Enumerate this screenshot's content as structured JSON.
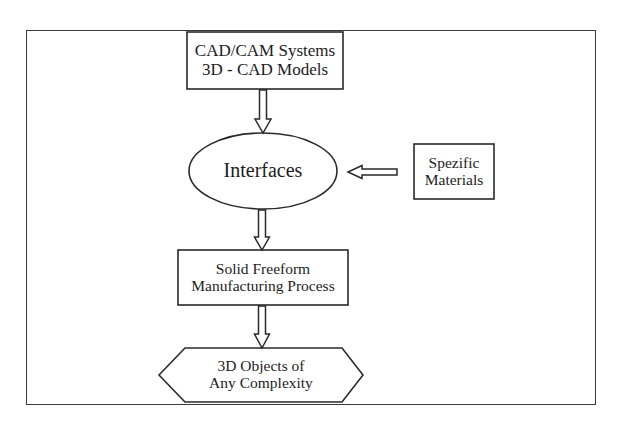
{
  "diagram": {
    "type": "flowchart",
    "stroke_color": "#2a2a2a",
    "background": "#ffffff",
    "nodes": [
      {
        "id": "cad",
        "shape": "rectangle",
        "lines": [
          "CAD/CAM Systems",
          "3D - CAD Models"
        ]
      },
      {
        "id": "interfaces",
        "shape": "ellipse",
        "lines": [
          "Interfaces"
        ]
      },
      {
        "id": "materials",
        "shape": "rectangle",
        "lines": [
          "Spezific",
          "Materials"
        ]
      },
      {
        "id": "sfm",
        "shape": "rectangle",
        "lines": [
          "Solid Freeform",
          "Manufacturing Process"
        ]
      },
      {
        "id": "objects",
        "shape": "hexagon",
        "lines": [
          "3D Objects of",
          "Any Complexity"
        ]
      }
    ],
    "edges": [
      {
        "from": "cad",
        "to": "interfaces",
        "style": "hollow-block-arrow",
        "direction": "down"
      },
      {
        "from": "materials",
        "to": "interfaces",
        "style": "hollow-block-arrow",
        "direction": "left"
      },
      {
        "from": "interfaces",
        "to": "sfm",
        "style": "hollow-block-arrow",
        "direction": "down"
      },
      {
        "from": "sfm",
        "to": "objects",
        "style": "hollow-block-arrow",
        "direction": "down"
      }
    ]
  }
}
